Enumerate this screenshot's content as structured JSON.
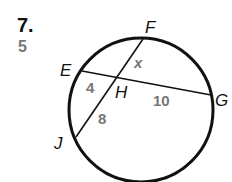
{
  "problem": {
    "number": "7.",
    "answer": "5"
  },
  "diagram": {
    "points": {
      "E": "E",
      "F": "F",
      "G": "G",
      "H": "H",
      "J": "J"
    },
    "segments": {
      "FH": "x",
      "EH": "4",
      "HG": "10",
      "HJ": "8"
    },
    "colors": {
      "line": "#111111",
      "value": "#777777"
    }
  }
}
